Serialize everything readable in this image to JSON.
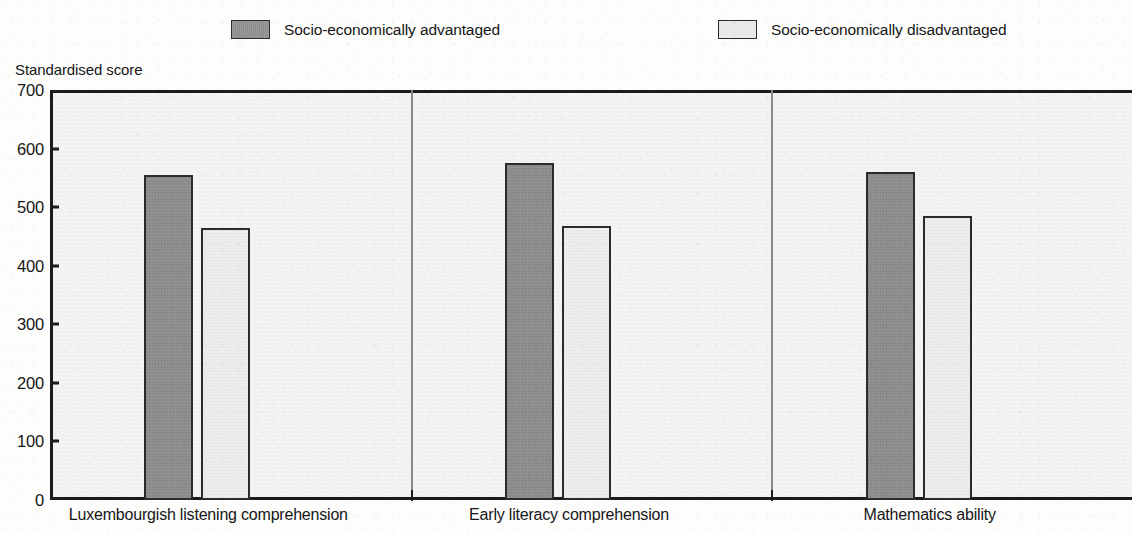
{
  "chart_data": {
    "type": "bar",
    "title": "",
    "subtitle": "",
    "xlabel": "",
    "ylabel": "Standardised score",
    "ylim": [
      0,
      700
    ],
    "y_ticks": [
      0,
      100,
      200,
      300,
      400,
      500,
      600,
      700
    ],
    "y_tick_labels": [
      "0",
      "100",
      "200",
      "300",
      "400",
      "500",
      "600",
      "700"
    ],
    "grid": false,
    "legend_position": "top",
    "categories": [
      "Luxembourgish listening comprehension",
      "Early literacy comprehension",
      "Mathematics ability"
    ],
    "series": [
      {
        "name": "Socio-economically advantaged",
        "color": "#8d8d8d",
        "values": [
          555,
          575,
          560
        ]
      },
      {
        "name": "Socio-economically disadvantaged",
        "color": "#ededeb",
        "values": [
          465,
          468,
          485
        ]
      }
    ]
  },
  "legend": {
    "items": [
      {
        "label": "Socio-economically advantaged",
        "swatch": "dark-swatch-icon"
      },
      {
        "label": "Socio-economically disadvantaged",
        "swatch": "light-swatch-icon"
      }
    ]
  },
  "axis": {
    "y_title": "Standardised score"
  },
  "colors": {
    "advantaged_fill": "#8d8d8d",
    "disadvantaged_fill": "#ededeb",
    "outline": "#2b2b2b",
    "axis": "#1c1c1c",
    "plot_background": "#f4f4f2",
    "page_background": "#fdfdfc"
  }
}
